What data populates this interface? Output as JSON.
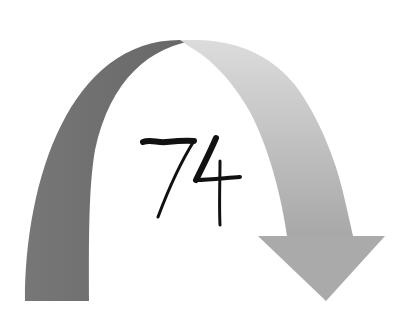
{
  "diagram": {
    "type": "curved-arrow",
    "label": "74",
    "direction": "clockwise, pointing down on the right",
    "colors": {
      "left_segment": "#6e6e6e",
      "right_segment_top": "#d8d8d8",
      "right_segment_bottom": "#a9a9a9",
      "arrowhead": "#aaaaaa",
      "label": "#111111",
      "background": "#ffffff"
    }
  }
}
